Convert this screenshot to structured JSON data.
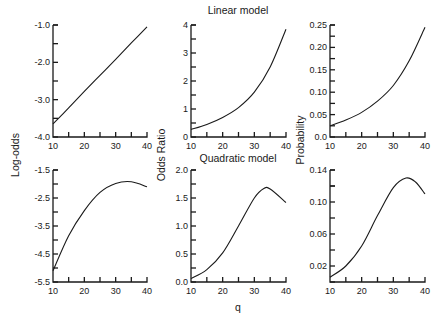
{
  "figure": {
    "top_title": "Linear model",
    "bottom_title": "Quadratic model",
    "xlabel": "q",
    "row_ylabels": [
      "Log-odds",
      "Odds Ratio",
      "Probability"
    ]
  },
  "chart_data": [
    {
      "type": "line",
      "title": "",
      "row": "Linear model",
      "xlabel": "",
      "ylabel": "Log-odds",
      "xlim": [
        10,
        40
      ],
      "ylim": [
        -4.0,
        -1.0
      ],
      "xticks": [
        "10",
        "20",
        "30",
        "40"
      ],
      "yticks": [
        "-4.0",
        "-3.0",
        "-2.0",
        "-1.0"
      ],
      "x": [
        10,
        15,
        20,
        25,
        30,
        35,
        40
      ],
      "y": [
        -3.65,
        -3.22,
        -2.78,
        -2.35,
        -1.92,
        -1.48,
        -1.05
      ]
    },
    {
      "type": "line",
      "title": "Linear model",
      "row": "Linear model",
      "xlabel": "",
      "ylabel": "Odds Ratio",
      "xlim": [
        10,
        40
      ],
      "ylim": [
        0,
        4
      ],
      "xticks": [
        "10",
        "20",
        "30",
        "40"
      ],
      "yticks": [
        "0",
        "1",
        "2",
        "3",
        "4"
      ],
      "x": [
        10,
        15,
        20,
        25,
        30,
        35,
        40
      ],
      "y": [
        0.27,
        0.45,
        0.7,
        1.05,
        1.6,
        2.5,
        3.85
      ]
    },
    {
      "type": "line",
      "title": "",
      "row": "Linear model",
      "xlabel": "",
      "ylabel": "Probability",
      "xlim": [
        10,
        40
      ],
      "ylim": [
        0.0,
        0.25
      ],
      "xticks": [
        "10",
        "20",
        "30",
        "40"
      ],
      "yticks": [
        "0.0",
        "0.05",
        "0.10",
        "0.15",
        "0.20",
        "0.25"
      ],
      "x": [
        10,
        15,
        20,
        25,
        30,
        35,
        40
      ],
      "y": [
        0.025,
        0.038,
        0.055,
        0.08,
        0.115,
        0.17,
        0.245
      ]
    },
    {
      "type": "line",
      "title": "",
      "row": "Quadratic model",
      "xlabel": "",
      "ylabel": "Log-odds",
      "xlim": [
        10,
        40
      ],
      "ylim": [
        -5.5,
        -1.5
      ],
      "xticks": [
        "10",
        "20",
        "30",
        "40"
      ],
      "yticks": [
        "-5.5",
        "-4.5",
        "-3.5",
        "-2.5",
        "-1.5"
      ],
      "x": [
        10,
        15,
        20,
        25,
        30,
        35,
        40
      ],
      "y": [
        -5.1,
        -3.85,
        -2.95,
        -2.3,
        -1.98,
        -1.92,
        -2.1
      ]
    },
    {
      "type": "line",
      "title": "Quadratic model",
      "row": "Quadratic model",
      "xlabel": "q",
      "ylabel": "Odds Ratio",
      "xlim": [
        10,
        40
      ],
      "ylim": [
        0.0,
        2.0
      ],
      "xticks": [
        "10",
        "20",
        "30",
        "40"
      ],
      "yticks": [
        "0.0",
        "0.5",
        "1.0",
        "1.5",
        "2.0"
      ],
      "x": [
        10,
        15,
        20,
        25,
        30,
        33,
        35,
        40
      ],
      "y": [
        0.06,
        0.22,
        0.52,
        1.0,
        1.5,
        1.67,
        1.66,
        1.42
      ]
    },
    {
      "type": "line",
      "title": "",
      "row": "Quadratic model",
      "xlabel": "",
      "ylabel": "Probability",
      "xlim": [
        10,
        40
      ],
      "ylim": [
        0.0,
        0.14
      ],
      "xticks": [
        "10",
        "20",
        "30",
        "40"
      ],
      "yticks": [
        "0.02",
        "0.06",
        "0.10",
        "0.14"
      ],
      "x": [
        10,
        15,
        20,
        25,
        30,
        34,
        37,
        40
      ],
      "y": [
        0.006,
        0.02,
        0.045,
        0.083,
        0.118,
        0.13,
        0.125,
        0.11
      ]
    }
  ]
}
